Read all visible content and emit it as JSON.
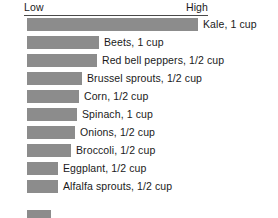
{
  "chart_data": {
    "type": "bar",
    "title": "",
    "subtitle": "",
    "xlabel": "",
    "ylabel": "",
    "orientation": "horizontal",
    "grid": false,
    "legend": "none",
    "axis_labels": {
      "low": "Low",
      "high": "High"
    },
    "axis_note": "Qualitative Low-to-High scale shown as a ruled header line; no numeric ticks.",
    "scale_min_label": "Low",
    "scale_max_label": "High",
    "value_unit": "relative (percent of full scale)",
    "xlim": [
      0,
      100
    ],
    "categories": [
      "Kale, 1 cup",
      "Beets, 1 cup",
      "Red bell peppers, 1/2 cup",
      "Brussel sprouts, 1/2 cup",
      "Corn, 1/2 cup",
      "Spinach, 1 cup",
      "Onions, 1/2 cup",
      "Broccoli, 1/2 cup",
      "Eggplant, 1/2 cup",
      "Alfalfa sprouts, 1/2 cup"
    ],
    "values": [
      93,
      39,
      38,
      30,
      28,
      27,
      26,
      24,
      17,
      17
    ],
    "bar_color": "#8c8c8c",
    "background_color": "#ffffff",
    "text_color": "#1a1a1a",
    "rule_color": "#4a4a4a",
    "items": [
      {
        "label": "Kale, 1 cup",
        "food": "Kale",
        "serving": "1 cup",
        "value": 93
      },
      {
        "label": "Beets, 1 cup",
        "food": "Beets",
        "serving": "1 cup",
        "value": 39
      },
      {
        "label": "Red bell peppers, 1/2 cup",
        "food": "Red bell peppers",
        "serving": "1/2 cup",
        "value": 38
      },
      {
        "label": "Brussel sprouts, 1/2 cup",
        "food": "Brussel sprouts",
        "serving": "1/2 cup",
        "value": 30
      },
      {
        "label": "Corn, 1/2 cup",
        "food": "Corn",
        "serving": "1/2 cup",
        "value": 28
      },
      {
        "label": "Spinach, 1 cup",
        "food": "Spinach",
        "serving": "1 cup",
        "value": 27
      },
      {
        "label": "Onions, 1/2 cup",
        "food": "Onions",
        "serving": "1/2 cup",
        "value": 26
      },
      {
        "label": "Broccoli, 1/2 cup",
        "food": "Broccoli",
        "serving": "1/2 cup",
        "value": 24
      },
      {
        "label": "Eggplant, 1/2 cup",
        "food": "Eggplant",
        "serving": "1/2 cup",
        "value": 17
      },
      {
        "label": "Alfalfa sprouts, 1/2 cup",
        "food": "Alfalfa sprouts",
        "serving": "1/2 cup",
        "value": 17
      }
    ]
  }
}
